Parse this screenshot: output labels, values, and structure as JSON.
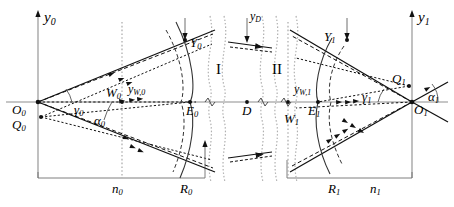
{
  "figure": {
    "type": "optical-ray-geometry-diagram",
    "title": "",
    "background": "#ffffff",
    "stroke_color": "#000000",
    "dotted_color": "#999999",
    "width": 454,
    "height": 207
  },
  "labels": {
    "y0_axis": "y",
    "y0_axis_sub": "0",
    "y1_axis": "y",
    "y1_axis_sub": "1",
    "O0": "O",
    "O0_sub": "0",
    "O1": "O",
    "O1_sub": "1",
    "Q0": "Q",
    "Q0_sub": "0",
    "Q1": "Q",
    "Q1_sub": "1",
    "Y0": "Y",
    "Y0_sub": "0",
    "Y1": "Y",
    "Y1_sub": "1",
    "W0": "W",
    "W0_sub": "0",
    "W1": "W",
    "W1_sub": "1",
    "E0": "E",
    "E0_sub": "0",
    "E1": "E",
    "E1_sub": "1",
    "D": "D",
    "yD": "y",
    "yD_sub": "D",
    "yW0": "y",
    "yW0_sub": "W,0",
    "yW1": "y",
    "yW1_sub": "W,1",
    "gamma0": "γ",
    "gamma0_sub": "0",
    "gamma1": "γ",
    "gamma1_sub": "1",
    "alpha0": "α",
    "alpha0_sub": "0",
    "alpha1": "α",
    "alpha1_sub": "1",
    "n0": "n",
    "n0_sub": "0",
    "n1": "n",
    "n1_sub": "1",
    "R0": "R",
    "R0_sub": "0",
    "R1": "R",
    "R1_sub": "1",
    "region_I": "I",
    "region_II": "II"
  },
  "geometry": {
    "optical_axis_y": 102,
    "O0_x": 38,
    "O1_x": 412,
    "Q0_y": 117,
    "Q1_y": 86,
    "baseline_y": 178,
    "E0_x": 190,
    "E1_x": 318,
    "D_x": 247,
    "W0_x": 122,
    "W1_x": 288,
    "left_arc_x": 196,
    "right_arc_x": 312
  }
}
